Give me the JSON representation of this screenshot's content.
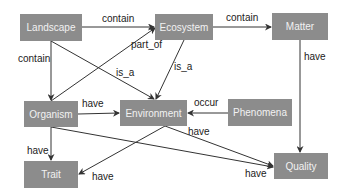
{
  "colors": {
    "node_fill": "#8c8c8c",
    "node_text": "#f2f2f2",
    "edge": "#333333",
    "label": "#222222"
  },
  "nodes": {
    "landscape": {
      "label": "Landscape"
    },
    "ecosystem": {
      "label": "Ecosystem"
    },
    "matter": {
      "label": "Matter"
    },
    "organism": {
      "label": "Organism"
    },
    "environment": {
      "label": "Environment"
    },
    "phenomena": {
      "label": "Phenomena"
    },
    "trait": {
      "label": "Trait"
    },
    "quality": {
      "label": "Quality"
    }
  },
  "edges": [
    {
      "from": "Landscape",
      "to": "Ecosystem",
      "label": "contain"
    },
    {
      "from": "Ecosystem",
      "to": "Matter",
      "label": "contain"
    },
    {
      "from": "Landscape",
      "to": "Organism",
      "label": "contain"
    },
    {
      "from": "Organism",
      "to": "Ecosystem",
      "label": "part_of"
    },
    {
      "from": "Landscape",
      "to": "Environment",
      "label": "is_a"
    },
    {
      "from": "Ecosystem",
      "to": "Environment",
      "label": "is_a"
    },
    {
      "from": "Matter",
      "to": "Quality",
      "label": "have"
    },
    {
      "from": "Organism",
      "to": "Environment",
      "label": "have"
    },
    {
      "from": "Phenomena",
      "to": "Environment",
      "label": "occur"
    },
    {
      "from": "Environment",
      "to": "Quality",
      "label": "have"
    },
    {
      "from": "Organism",
      "to": "Trait",
      "label": "have"
    },
    {
      "from": "Environment",
      "to": "Trait",
      "label": "have"
    },
    {
      "from": "Organism",
      "to": "Quality",
      "label": "have"
    }
  ]
}
